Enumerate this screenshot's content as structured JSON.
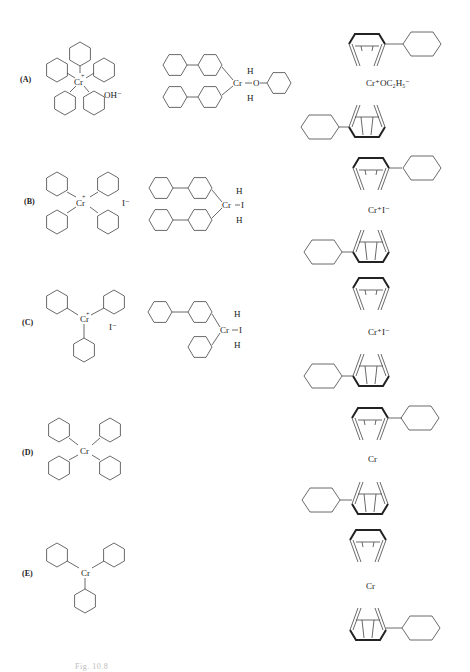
{
  "figure": {
    "rows": [
      {
        "label": "(A)",
        "ionic": {
          "center": "Cr",
          "charge": "+",
          "counterion": "OH⁻"
        },
        "covalent": {
          "center": "Cr",
          "ligands": [
            "H",
            "O",
            "H"
          ]
        },
        "sandwich": {
          "text": "Cr⁺OC₂H₅⁻"
        }
      },
      {
        "label": "(B)",
        "ionic": {
          "center": "Cr",
          "charge": "+",
          "counterion": "I⁻"
        },
        "covalent": {
          "center": "Cr",
          "ligands": [
            "H",
            "I",
            "H"
          ]
        },
        "sandwich": {
          "text": "Cr⁺I⁻"
        }
      },
      {
        "label": "(C)",
        "ionic": {
          "center": "Cr",
          "charge": "+",
          "counterion": "I⁻"
        },
        "covalent": {
          "center": "Cr",
          "ligands": [
            "H",
            "I",
            "H"
          ]
        },
        "sandwich": {
          "text": "Cr⁺I⁻"
        }
      },
      {
        "label": "(D)",
        "ionic": {
          "center": "Cr"
        },
        "sandwich": {
          "text": "Cr"
        }
      },
      {
        "label": "(E)",
        "ionic": {
          "center": "Cr"
        },
        "sandwich": {
          "text": "Cr"
        }
      }
    ],
    "caption": "Fig. 10.8"
  }
}
